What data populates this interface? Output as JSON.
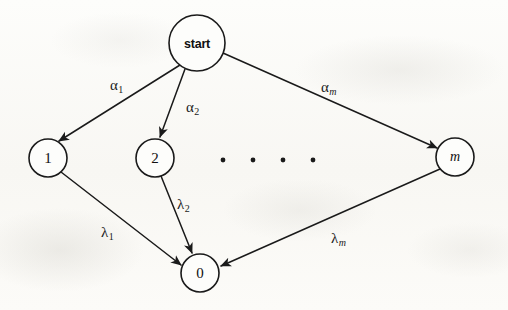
{
  "figure": {
    "kind": "state-transition-diagram",
    "background_color": "#fbfbf9",
    "stroke_color": "#1a1a1a"
  },
  "nodes": [
    {
      "id": "start",
      "label": "start",
      "cx": 197,
      "cy": 43,
      "r": 28
    },
    {
      "id": "1",
      "label": "1",
      "cx": 48,
      "cy": 158,
      "r": 19
    },
    {
      "id": "2",
      "label": "2",
      "cx": 155,
      "cy": 158,
      "r": 19
    },
    {
      "id": "m",
      "label": "m",
      "cx": 455,
      "cy": 157,
      "r": 19
    },
    {
      "id": "0",
      "label": "0",
      "cx": 200,
      "cy": 273,
      "r": 19
    }
  ],
  "edges": [
    {
      "id": "start-to-1",
      "from": "start",
      "to": "1",
      "label_base": "α",
      "label_sub": "1",
      "label_sub_italic": false,
      "label_x": 110,
      "label_y": 78
    },
    {
      "id": "start-to-2",
      "from": "start",
      "to": "2",
      "label_base": "α",
      "label_sub": "2",
      "label_sub_italic": false,
      "label_x": 186,
      "label_y": 100
    },
    {
      "id": "start-to-m",
      "from": "start",
      "to": "m",
      "label_base": "α",
      "label_sub": "m",
      "label_sub_italic": true,
      "label_x": 321,
      "label_y": 80
    },
    {
      "id": "1-to-0",
      "from": "1",
      "to": "0",
      "label_base": "λ",
      "label_sub": "1",
      "label_sub_italic": false,
      "label_x": 101,
      "label_y": 225
    },
    {
      "id": "2-to-0",
      "from": "2",
      "to": "0",
      "label_base": "λ",
      "label_sub": "2",
      "label_sub_italic": false,
      "label_x": 177,
      "label_y": 197
    },
    {
      "id": "m-to-0",
      "from": "m",
      "to": "0",
      "label_base": "λ",
      "label_sub": "m",
      "label_sub_italic": true,
      "label_x": 331,
      "label_y": 231
    }
  ],
  "ellipsis_dots": {
    "label": "ellipsis between node 2 and node m",
    "y": 160,
    "x_positions": [
      223,
      253,
      283,
      313
    ],
    "radius": 2.4
  }
}
